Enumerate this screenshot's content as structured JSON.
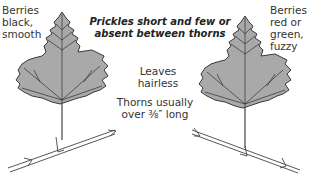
{
  "left_specimen": {
    "label_lines": [
      "Berries",
      "black,",
      "smooth"
    ]
  },
  "right_specimen": {
    "label_lines": [
      "Berries",
      "red or",
      "green,",
      "fuzzy"
    ]
  },
  "captions": {
    "prickles": [
      "Prickles short and few or",
      "absent between thorns"
    ],
    "leaves": "Leaves hairless",
    "thorns": [
      "Thorns usually",
      "over ⅜″ long"
    ]
  },
  "colors": {
    "leaf_fill": "#a9a9a9",
    "leaf_outline": "#3a3a3a",
    "vein": "#2e2e2e",
    "stem": "#444444"
  }
}
